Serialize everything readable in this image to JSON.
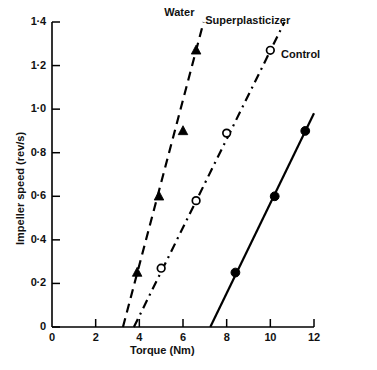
{
  "chart_data": {
    "type": "line",
    "title": "",
    "xlabel": "Torque (Nm)",
    "ylabel": "Impeller speed (rev/s)",
    "xlim": [
      0,
      12
    ],
    "ylim": [
      0,
      1.4
    ],
    "xticks": [
      "0",
      "2",
      "4",
      "6",
      "8",
      "10",
      "12"
    ],
    "xtick_values": [
      0,
      2,
      4,
      6,
      8,
      10,
      12
    ],
    "yticks": [
      "0",
      "0·2",
      "0·4",
      "0·6",
      "0·8",
      "1·0",
      "1·2",
      "1·4"
    ],
    "ytick_values": [
      0,
      0.2,
      0.4,
      0.6,
      0.8,
      1.0,
      1.2,
      1.4
    ],
    "grid": false,
    "legend_position": "inline-annotations",
    "series": [
      {
        "name": "Water",
        "marker": "filled-triangle",
        "linestyle": "dashed",
        "color": "#000000",
        "x": [
          3.9,
          4.9,
          6.0,
          6.6
        ],
        "y": [
          0.25,
          0.6,
          0.9,
          1.27
        ],
        "intercept_x": 3.25,
        "label_x": 6.15,
        "label_y": 1.47
      },
      {
        "name": "Superplasticizer",
        "marker": "open-circle",
        "linestyle": "dash-dot",
        "color": "#000000",
        "x": [
          5.0,
          6.6,
          8.0,
          10.0
        ],
        "y": [
          0.27,
          0.58,
          0.89,
          1.27
        ],
        "intercept_x": 3.75,
        "label_x": 8.3,
        "label_y": 1.42
      },
      {
        "name": "Control",
        "marker": "filled-circle",
        "linestyle": "solid",
        "color": "#000000",
        "x": [
          8.4,
          10.2,
          11.6
        ],
        "y": [
          0.25,
          0.6,
          0.9
        ],
        "intercept_x": 7.25,
        "label_x": 11.5,
        "label_y": 1.3
      }
    ]
  },
  "axes": {
    "x_title": "Torque (Nm)",
    "y_title": "Impeller speed (rev/s)"
  },
  "annotations": {
    "water": "Water",
    "superplasticizer": "Superplasticizer",
    "control": "Control"
  }
}
